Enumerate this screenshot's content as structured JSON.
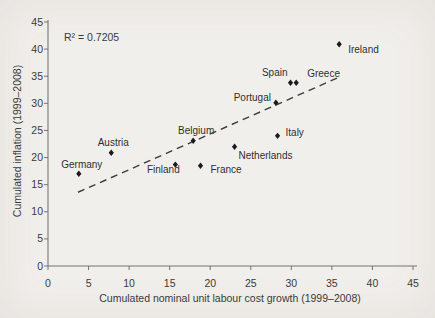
{
  "figure": {
    "background_color": "#f1efeb",
    "kind": "scanned scatter plot figure"
  },
  "chart_data": {
    "type": "scatter",
    "title": "",
    "xlabel": "Cumulated nominal unit labour cost growth (1999–2008)",
    "ylabel": "Cumulated inflation (1999–2008)",
    "xlim": [
      0,
      45
    ],
    "ylim": [
      0,
      45
    ],
    "xticks": [
      0,
      5,
      10,
      15,
      20,
      25,
      30,
      35,
      40,
      45
    ],
    "yticks": [
      0,
      5,
      10,
      15,
      20,
      25,
      30,
      35,
      40,
      45
    ],
    "grid": false,
    "legend_position": "none",
    "annotation": {
      "text": "R² = 0.7205",
      "r_squared": 0.7205,
      "position": "top-left"
    },
    "marker": {
      "shape": "diamond",
      "color": "#1b1b1b"
    },
    "colors": {
      "axis": "#757575",
      "text": "#3a3a3a",
      "trendline": "#3c3c3c",
      "background": "#f1efeb"
    },
    "points": [
      {
        "label": "Germany",
        "x": 3.8,
        "y": 17.0,
        "anchor": "middle",
        "dx": 3,
        "dy": -6
      },
      {
        "label": "Austria",
        "x": 7.8,
        "y": 20.9,
        "anchor": "middle",
        "dx": 2,
        "dy": -7
      },
      {
        "label": "Finland",
        "x": 15.7,
        "y": 18.7,
        "anchor": "middle",
        "dx": -12,
        "dy": 8
      },
      {
        "label": "Belgium",
        "x": 17.9,
        "y": 23.1,
        "anchor": "middle",
        "dx": 3,
        "dy": -7
      },
      {
        "label": "France",
        "x": 18.8,
        "y": 18.5,
        "anchor": "start",
        "dx": 10,
        "dy": 7
      },
      {
        "label": "Netherlands",
        "x": 23.0,
        "y": 22.0,
        "anchor": "start",
        "dx": 4,
        "dy": 12
      },
      {
        "label": "Italy",
        "x": 28.3,
        "y": 24.0,
        "anchor": "start",
        "dx": 8,
        "dy": 0
      },
      {
        "label": "Portugal",
        "x": 28.1,
        "y": 30.1,
        "anchor": "end",
        "dx": -5,
        "dy": -2
      },
      {
        "label": "Spain",
        "x": 29.9,
        "y": 33.8,
        "anchor": "end",
        "dx": -3,
        "dy": -7
      },
      {
        "label": "Greece",
        "x": 30.6,
        "y": 33.8,
        "anchor": "start",
        "dx": 11,
        "dy": -6
      },
      {
        "label": "Ireland",
        "x": 35.9,
        "y": 40.9,
        "anchor": "start",
        "dx": 9,
        "dy": 9
      }
    ],
    "trendline": {
      "style": "dashed",
      "x1": 3.7,
      "y1": 13.6,
      "x2": 35.7,
      "y2": 34.7
    }
  }
}
